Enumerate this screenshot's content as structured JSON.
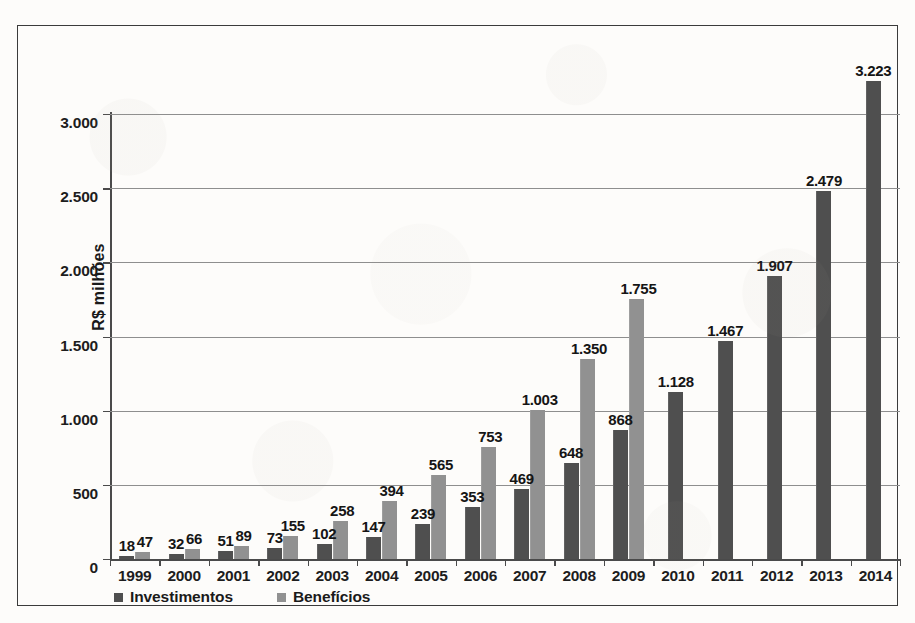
{
  "chart_data": {
    "type": "bar",
    "title": "",
    "subtitle": "",
    "xlabel": "",
    "ylabel": "R$ milhões",
    "ylim": [
      0,
      3000
    ],
    "yticks": [
      0,
      500,
      1000,
      1500,
      2000,
      2500,
      3000
    ],
    "ytick_labels": [
      "0",
      "500",
      "1.000",
      "1.500",
      "2.000",
      "2.500",
      "3.000"
    ],
    "grid": true,
    "legend_position": "bottom-left",
    "categories": [
      "1999",
      "2000",
      "2001",
      "2002",
      "2003",
      "2004",
      "2005",
      "2006",
      "2007",
      "2008",
      "2009",
      "2010",
      "2011",
      "2012",
      "2013",
      "2014"
    ],
    "series": [
      {
        "name": "Investimentos",
        "color": "#4f4f4f",
        "values": [
          18,
          32,
          51,
          73,
          102,
          147,
          239,
          353,
          469,
          648,
          868,
          1128,
          1467,
          1907,
          2479,
          3223
        ],
        "labels": [
          "18",
          "32",
          "51",
          "73",
          "102",
          "147",
          "239",
          "353",
          "469",
          "648",
          "868",
          "1.128",
          "1.467",
          "1.907",
          "2.479",
          "3.223"
        ]
      },
      {
        "name": "Benefícios",
        "color": "#919191",
        "values": [
          47,
          66,
          89,
          155,
          258,
          394,
          565,
          753,
          1003,
          1350,
          1755,
          null,
          null,
          null,
          null,
          null
        ],
        "labels": [
          "47",
          "66",
          "89",
          "155",
          "258",
          "394",
          "565",
          "753",
          "1.003",
          "1.350",
          "1.755",
          "",
          "",
          "",
          "",
          ""
        ]
      }
    ]
  },
  "legend": {
    "items": [
      {
        "label": "Investimentos",
        "color": "#4f4f4f"
      },
      {
        "label": "Benefícios",
        "color": "#919191"
      }
    ]
  },
  "axes": {
    "y_title": "R$ milhões"
  }
}
